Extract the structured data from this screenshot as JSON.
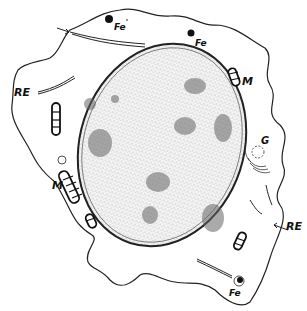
{
  "diagram": {
    "labels": {
      "fe_top_left": "Fe",
      "fe_top_right": "Fe",
      "fe_bottom": "Fe",
      "m_right": "M",
      "m_left": "M",
      "re_left": "RE",
      "re_right": "RE",
      "g": "G"
    }
  }
}
